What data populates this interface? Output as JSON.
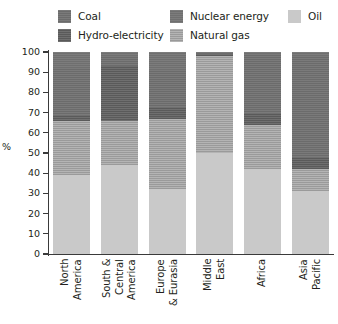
{
  "legend": {
    "items": [
      {
        "label": "Coal",
        "key": "coal",
        "color": "#6b6b6b",
        "row": 0,
        "col": 0
      },
      {
        "label": "Hydro-electricity",
        "key": "hydro",
        "color": "#5a5a5a",
        "row": 1,
        "col": 0
      },
      {
        "label": "Nuclear energy",
        "key": "nuclear",
        "color": "#6f6f6f",
        "row": 0,
        "col": 1
      },
      {
        "label": "Natural gas",
        "key": "gas",
        "color": "#9a9a9a",
        "row": 1,
        "col": 1
      },
      {
        "label": "Oil",
        "key": "oil",
        "color": "#c9c9c9",
        "row": 0,
        "col": 2
      }
    ]
  },
  "axis": {
    "y_title": "%",
    "y_ticks": [
      "100",
      "90",
      "80",
      "70",
      "60",
      "50",
      "40",
      "30",
      "20",
      "10",
      "0"
    ],
    "y_min": 0,
    "y_max": 100
  },
  "chart_data": {
    "type": "bar",
    "title": "",
    "subtitle": "",
    "xlabel": "",
    "ylabel": "%",
    "ylim": [
      0,
      100
    ],
    "grid": false,
    "stacked": true,
    "legend_position": "top",
    "categories": [
      "North\nAmerica",
      "South &\nCentral\nAmerica",
      "Europe\n& Eurasia",
      "Middle\nEast",
      "Africa",
      "Asia\nPacific"
    ],
    "series": [
      {
        "name": "Oil",
        "key": "oil",
        "color": "#c9c9c9",
        "values": [
          39,
          44,
          32,
          50,
          42,
          31
        ]
      },
      {
        "name": "Natural gas",
        "key": "gas",
        "color": "#9a9a9a",
        "values": [
          27,
          22,
          35,
          48,
          22,
          11
        ]
      },
      {
        "name": "Hydro-electricity",
        "key": "hydro",
        "color": "#5a5a5a",
        "values": [
          3,
          27,
          6,
          1,
          6,
          6
        ]
      },
      {
        "name": "Coal",
        "key": "coal",
        "color": "#6b6b6b",
        "values": [
          23,
          5,
          18,
          1,
          29,
          50
        ]
      },
      {
        "name": "Nuclear energy",
        "key": "nuclear",
        "color": "#6f6f6f",
        "values": [
          8,
          2,
          9,
          0,
          1,
          2
        ]
      }
    ],
    "stack_order_bottom_to_top": [
      "oil",
      "gas",
      "hydro",
      "coal",
      "nuclear"
    ]
  }
}
